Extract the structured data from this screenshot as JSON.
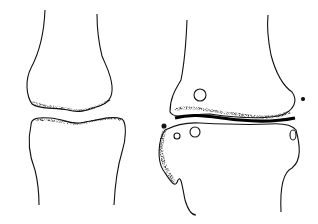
{
  "figure": {
    "panels": [
      {
        "id": "healthy-joint",
        "position": "left",
        "features": [
          "upper bone end",
          "lower bone end",
          "uniform joint space"
        ]
      },
      {
        "id": "degenerated-joint",
        "position": "right",
        "features": [
          "narrowed joint space",
          "bone spurs",
          "cysts",
          "loose fragments"
        ]
      }
    ],
    "colors": {
      "ink": "#111111",
      "background": "#ffffff"
    }
  }
}
